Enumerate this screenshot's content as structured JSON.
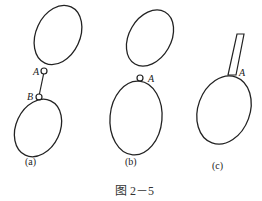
{
  "figure": {
    "caption": "图 2－5",
    "panels": [
      {
        "id": "a",
        "label": "(a)",
        "description": "Two ellipses connected by a rod with pin joints A and B",
        "points": [
          "A",
          "B"
        ]
      },
      {
        "id": "b",
        "label": "(b)",
        "description": "Two ellipses joined directly at pin A",
        "points": [
          "A"
        ]
      },
      {
        "id": "c",
        "label": "(c)",
        "description": "Ellipse with rigidly attached rod at A",
        "points": [
          "A"
        ]
      }
    ]
  }
}
